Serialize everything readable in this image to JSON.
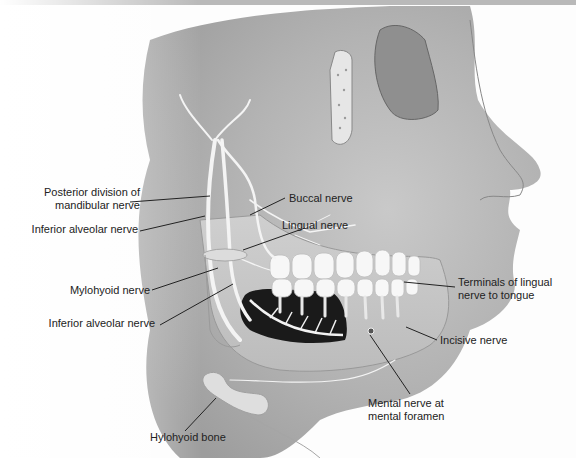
{
  "figure": {
    "labels": {
      "posterior_division": [
        "Posterior division of",
        "mandibular nerve"
      ],
      "buccal": "Buccal nerve",
      "lingual": "Lingual nerve",
      "inferior_alveolar_upper": "Inferior alveolar nerve",
      "mylohyoid": "Mylohyoid nerve",
      "inferior_alveolar_lower": "Inferior alveolar nerve",
      "terminals_lingual": [
        "Terminals of lingual",
        "nerve to tongue"
      ],
      "incisive": "Incisive nerve",
      "hyoid": "Hylohyoid bone",
      "mental": [
        "Mental nerve at",
        "mental foramen"
      ]
    },
    "colors": {
      "background": "#fdfdfd",
      "skin_shadow": "#a8a8a8",
      "skin_light": "#dcdcdc",
      "nerve": "#f4f4f4",
      "mouth_cavity": "#1a1a1a",
      "teeth": "#f7f7f7",
      "leader_line": "#222222",
      "top_bar": "#b9b9b9"
    }
  }
}
